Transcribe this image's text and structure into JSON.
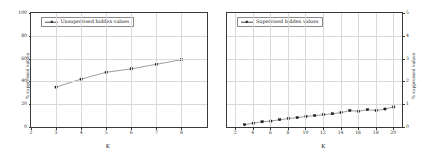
{
  "figure": {
    "background": "#ffffff",
    "line_color": "#4a4a4a",
    "marker_color": "#1c1c1c",
    "grid_color": "#d9d9d9",
    "axis_color": "#3a3a3a"
  },
  "chart_data": [
    {
      "type": "line",
      "title": "",
      "xlabel": "K",
      "ylabel": "% suppressed values",
      "yaxis_side": "left",
      "grid": true,
      "legend_position": "upper left",
      "xlim": [
        2,
        9
      ],
      "ylim": [
        0,
        100
      ],
      "xticks": [
        2,
        3,
        4,
        5,
        6,
        7,
        8
      ],
      "yticks": [
        0,
        20,
        40,
        60,
        80,
        100
      ],
      "series": [
        {
          "name": "Unsupervised hidden values",
          "x": [
            3,
            4,
            5,
            6,
            7,
            8
          ],
          "values": [
            35,
            42,
            48,
            51,
            55,
            59
          ]
        }
      ]
    },
    {
      "type": "line",
      "title": "",
      "xlabel": "K",
      "ylabel": "% suppressed values",
      "yaxis_side": "right",
      "grid": true,
      "legend_position": "upper left",
      "xlim": [
        1,
        21
      ],
      "ylim": [
        0,
        5
      ],
      "xticks": [
        2,
        4,
        6,
        8,
        10,
        12,
        14,
        16,
        18,
        20
      ],
      "yticks": [
        0,
        1,
        2,
        3,
        4,
        5
      ],
      "series": [
        {
          "name": "Supervised hidden values",
          "x": [
            3,
            4,
            5,
            6,
            7,
            8,
            9,
            10,
            11,
            12,
            13,
            14,
            15,
            16,
            17,
            18,
            19,
            20
          ],
          "values": [
            0.1,
            0.17,
            0.23,
            0.26,
            0.32,
            0.37,
            0.41,
            0.46,
            0.5,
            0.54,
            0.58,
            0.63,
            0.72,
            0.69,
            0.76,
            0.72,
            0.79,
            0.88
          ]
        }
      ]
    }
  ]
}
